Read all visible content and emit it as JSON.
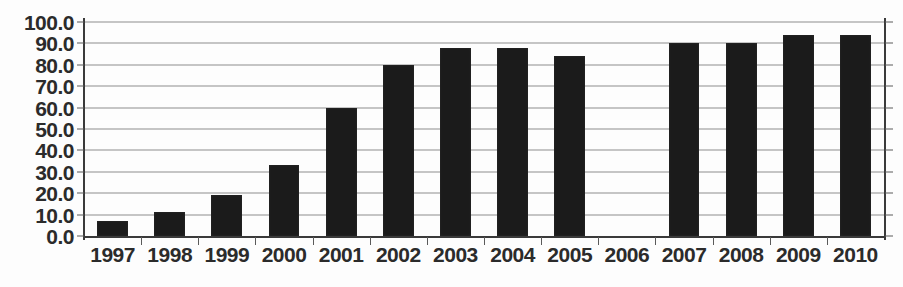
{
  "chart_data": {
    "type": "bar",
    "title": "",
    "subtitle": "",
    "xlabel": "",
    "ylabel": "",
    "categories": [
      "1997",
      "1998",
      "1999",
      "2000",
      "2001",
      "2002",
      "2003",
      "2004",
      "2005",
      "2006",
      "2007",
      "2008",
      "2009",
      "2010"
    ],
    "values": [
      7,
      11,
      19,
      33,
      60,
      80,
      88,
      88,
      84,
      null,
      90,
      90,
      94,
      94
    ],
    "series": [
      {
        "name": "",
        "values": [
          7,
          11,
          19,
          33,
          60,
          80,
          88,
          88,
          84,
          null,
          90,
          90,
          94,
          94
        ]
      }
    ],
    "ylim": [
      0,
      100
    ],
    "ytick_values": [
      0,
      10,
      20,
      30,
      40,
      50,
      60,
      70,
      80,
      90,
      100
    ],
    "ytick_labels": [
      "0.0",
      "10.0",
      "20.0",
      "30.0",
      "40.0",
      "50.0",
      "60.0",
      "70.0",
      "80.0",
      "90.0",
      "100.0"
    ],
    "grid": true,
    "grid_axis": "y",
    "legend": false,
    "legend_position": "none",
    "bar_color": "#1b1b1b",
    "gridline_color": "#8d8d8d",
    "axis_color": "#3a3a3a",
    "text_color": "#2b2b2b",
    "background_color": "#fdfdfd",
    "annotations": []
  }
}
